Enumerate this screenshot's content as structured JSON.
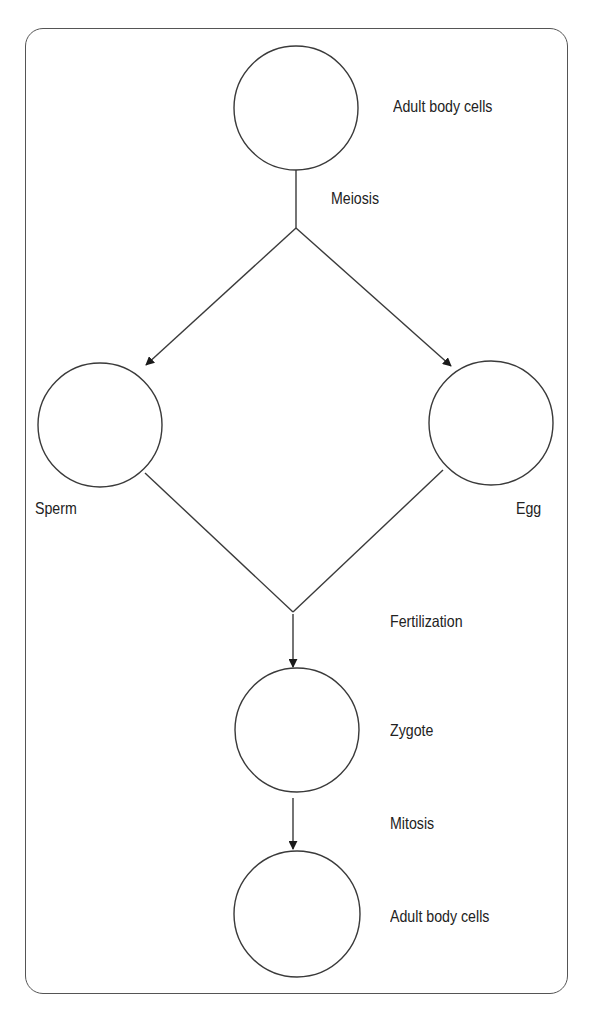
{
  "diagram": {
    "type": "flowchart",
    "title": "",
    "colors": {
      "stroke": "#3a3a3a",
      "border": "#555555",
      "text": "#222222",
      "background": "#ffffff"
    },
    "nodes": [
      {
        "id": "adult_top",
        "shape": "circle",
        "label": "Adult body cells"
      },
      {
        "id": "sperm",
        "shape": "circle",
        "label": "Sperm"
      },
      {
        "id": "egg",
        "shape": "circle",
        "label": "Egg"
      },
      {
        "id": "zygote",
        "shape": "circle",
        "label": "Zygote"
      },
      {
        "id": "adult_bottom",
        "shape": "circle",
        "label": "Adult body cells"
      }
    ],
    "edges": [
      {
        "from": "adult_top",
        "to": "sperm",
        "label": "Meiosis"
      },
      {
        "from": "adult_top",
        "to": "egg",
        "label": "Meiosis"
      },
      {
        "from": "sperm",
        "to": "zygote",
        "label": "Fertilization"
      },
      {
        "from": "egg",
        "to": "zygote",
        "label": "Fertilization"
      },
      {
        "from": "zygote",
        "to": "adult_bottom",
        "label": "Mitosis"
      }
    ],
    "process_labels": {
      "meiosis": "Meiosis",
      "fertilization": "Fertilization",
      "mitosis": "Mitosis"
    }
  }
}
